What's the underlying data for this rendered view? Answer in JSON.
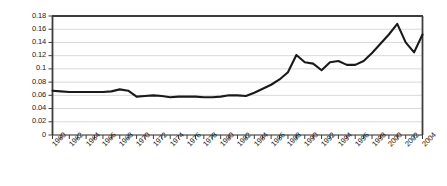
{
  "chart_data": {
    "type": "line",
    "title": "",
    "subtitle": "",
    "xlabel": "",
    "ylabel": "",
    "xlim": [
      1960,
      2005
    ],
    "ylim": [
      0,
      0.18
    ],
    "grid": true,
    "legend": false,
    "legend_position": "none",
    "y_ticks": [
      "0",
      "0.02",
      "0.04",
      "0.06",
      "0.08",
      "0.1",
      "0.12",
      "0.14",
      "0.16",
      "0.18"
    ],
    "y_tick_values": [
      0,
      0.02,
      0.04,
      0.06,
      0.08,
      0.1,
      0.12,
      0.14,
      0.16,
      0.18
    ],
    "x_tick_labels": [
      "1960",
      "1962",
      "1964",
      "1966",
      "1968",
      "1970",
      "1972",
      "1974",
      "1976",
      "1978",
      "1980",
      "1982",
      "1984",
      "1986",
      "1988",
      "1990",
      "1992",
      "1994",
      "1996",
      "1998",
      "2000",
      "2002",
      "2004"
    ],
    "x": [
      1960,
      1961,
      1962,
      1963,
      1964,
      1965,
      1966,
      1967,
      1968,
      1969,
      1970,
      1971,
      1972,
      1973,
      1974,
      1975,
      1976,
      1977,
      1978,
      1979,
      1980,
      1981,
      1982,
      1983,
      1984,
      1985,
      1986,
      1987,
      1988,
      1989,
      1990,
      1991,
      1992,
      1993,
      1994,
      1995,
      1996,
      1997,
      1998,
      1999,
      2000,
      2001,
      2002,
      2003,
      2004
    ],
    "series": [
      {
        "name": "value",
        "color": "#1a1a1a",
        "values": [
          0.067,
          0.066,
          0.065,
          0.065,
          0.065,
          0.065,
          0.065,
          0.066,
          0.069,
          0.067,
          0.058,
          0.059,
          0.06,
          0.059,
          0.057,
          0.058,
          0.058,
          0.058,
          0.057,
          0.057,
          0.058,
          0.06,
          0.06,
          0.059,
          0.064,
          0.07,
          0.076,
          0.084,
          0.095,
          0.121,
          0.11,
          0.108,
          0.098,
          0.11,
          0.112,
          0.106,
          0.106,
          0.112,
          0.124,
          0.138,
          0.152,
          0.168,
          0.14,
          0.125,
          0.152
        ]
      }
    ]
  },
  "axes": {
    "y_axis_name": "y-axis",
    "x_axis_name": "x-axis"
  }
}
